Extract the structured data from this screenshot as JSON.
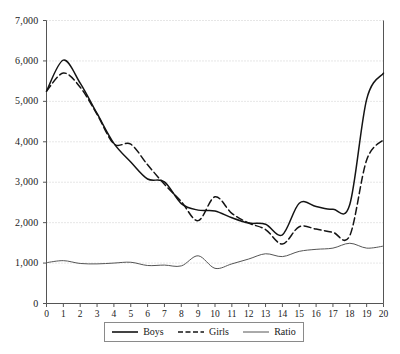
{
  "chart_data": {
    "type": "line",
    "title": "",
    "subtitle": "",
    "xlabel": "",
    "ylabel": "",
    "xlim": [
      0,
      20
    ],
    "ylim": [
      0,
      7000
    ],
    "grid": true,
    "grid_axis": "y",
    "legend_position": "bottom",
    "x": [
      0,
      1,
      2,
      3,
      4,
      5,
      6,
      7,
      8,
      9,
      10,
      11,
      12,
      13,
      14,
      15,
      16,
      17,
      18,
      19,
      20
    ],
    "x_tick_labels": [
      "0",
      "1",
      "2",
      "3",
      "4",
      "5",
      "6",
      "7",
      "8",
      "9",
      "10",
      "11",
      "12",
      "13",
      "14",
      "15",
      "16",
      "17",
      "18",
      "19",
      "20"
    ],
    "y_tick_values": [
      0,
      1000,
      2000,
      3000,
      4000,
      5000,
      6000,
      7000
    ],
    "y_tick_labels": [
      "0",
      "1,000",
      "2,000",
      "3,000",
      "4,000",
      "5,000",
      "6,000",
      "7,000"
    ],
    "series": [
      {
        "name": "Boys",
        "style": "solid",
        "color": "#141414",
        "width": 1.5,
        "values": [
          5250,
          6020,
          5450,
          4700,
          3960,
          3500,
          3080,
          3010,
          2470,
          2310,
          2290,
          2120,
          1990,
          1960,
          1700,
          2480,
          2400,
          2330,
          2450,
          5050,
          5700
        ]
      },
      {
        "name": "Girls",
        "style": "dashed",
        "color": "#141414",
        "width": 1.5,
        "values": [
          5250,
          5700,
          5350,
          4680,
          3950,
          3940,
          3430,
          2950,
          2520,
          2050,
          2640,
          2230,
          1990,
          1830,
          1470,
          1900,
          1840,
          1760,
          1680,
          3550,
          4050
        ]
      },
      {
        "name": "Ratio",
        "style": "solid",
        "color": "#555555",
        "width": 1,
        "values": [
          1010,
          1060,
          990,
          980,
          1000,
          1020,
          940,
          950,
          930,
          1180,
          870,
          980,
          1100,
          1230,
          1160,
          1290,
          1340,
          1370,
          1490,
          1370,
          1420
        ]
      }
    ]
  },
  "legend": {
    "entries": [
      {
        "label": "Boys",
        "style": "solid",
        "width": 1.6
      },
      {
        "label": "Girls",
        "style": "dashed",
        "width": 1.6
      },
      {
        "label": "Ratio",
        "style": "solid",
        "width": 1
      }
    ]
  },
  "axes": {
    "y_axis_name": "y-axis",
    "x_axis_name": "x-axis"
  }
}
